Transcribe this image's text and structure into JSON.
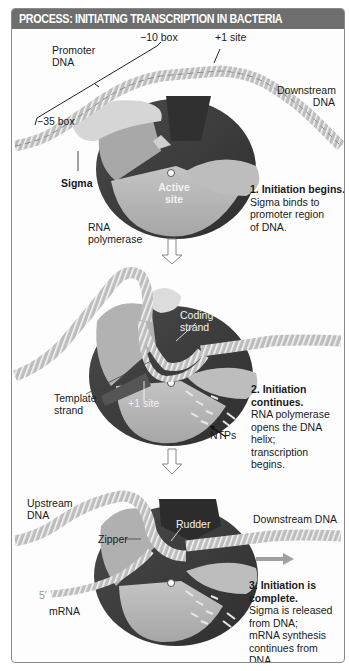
{
  "title": "PROCESS: INITIATING TRANSCRIPTION IN BACTERIA",
  "panels": [
    {
      "labels": {
        "promoter_dna_line1": "Promoter",
        "promoter_dna_line2": "DNA",
        "minus10_box": "−10 box",
        "minus35_box": "−35 box",
        "plus1_site": "+1 site",
        "downstream_dna_line1": "Downstream",
        "downstream_dna_line2": "DNA",
        "sigma": "Sigma",
        "active_site_line1": "Active",
        "active_site_line2": "site",
        "rna_polymerase_line1": "RNA",
        "rna_polymerase_line2": "polymerase"
      },
      "step": {
        "heading": "1. Initiation begins.",
        "body_lines": [
          "Sigma binds to",
          "promoter region",
          "of DNA."
        ]
      }
    },
    {
      "labels": {
        "coding_strand_line1": "Coding",
        "coding_strand_line2": "strand",
        "template_strand_line1": "Template",
        "template_strand_line2": "strand",
        "plus1_site": "+1 site",
        "ntps": "NTPs"
      },
      "step": {
        "heading_line1": "2. Initiation",
        "heading_line2": "continues.",
        "body_lines": [
          "RNA polymerase",
          "opens the DNA",
          "helix;",
          "transcription",
          "begins."
        ]
      }
    },
    {
      "labels": {
        "upstream_dna_line1": "Upstream",
        "upstream_dna_line2": "DNA",
        "downstream_dna": "Downstream DNA",
        "zipper": "Zipper",
        "rudder": "Rudder",
        "five_prime": "5′",
        "mrna": "mRNA"
      },
      "step": {
        "heading_line1": "3. Initiation is",
        "heading_line2": "complete.",
        "body_lines": [
          "Sigma is released",
          "from DNA;",
          "mRNA synthesis",
          "continues from",
          "DNA."
        ]
      }
    }
  ],
  "icons": {
    "flow_arrow": "down-arrow-outline",
    "release_arrow": "right-arrow-gray"
  },
  "colors": {
    "title_bar": "#6e6e6e",
    "polymerase_light": "#b8b8b8",
    "polymerase_dark": "#3c3c3c",
    "polymerase_mid": "#5a5a5a",
    "sigma": "#d0d0d0",
    "dna": "#a8a8a8",
    "border": "#8a8a8a"
  }
}
